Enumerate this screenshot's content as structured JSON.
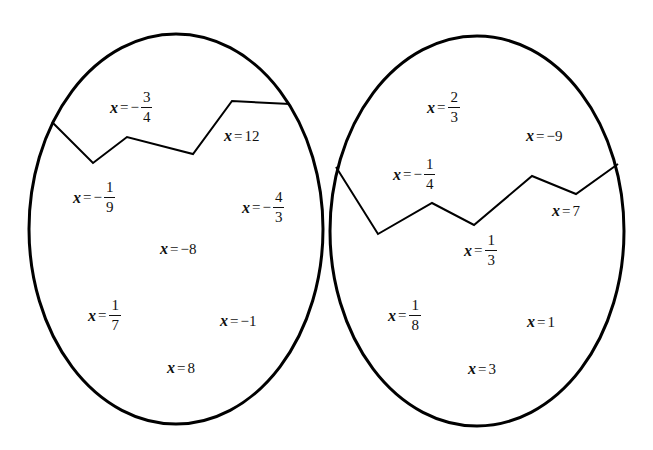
{
  "diagram": {
    "type": "two-cracked-eggs",
    "stroke_color": "#000000",
    "background": "#ffffff",
    "eggs": [
      {
        "id": "left-egg",
        "ellipse": {
          "cx": 176,
          "cy": 229,
          "rx": 147,
          "ry": 195
        },
        "crack_points": [
          [
            52,
            122
          ],
          [
            93,
            163
          ],
          [
            127,
            137
          ],
          [
            193,
            154
          ],
          [
            232,
            101
          ],
          [
            290,
            104
          ]
        ],
        "labels": [
          {
            "var": "x",
            "eq": "=",
            "sign": "−",
            "num": "3",
            "den": "4",
            "x": 110,
            "y": 90
          },
          {
            "var": "x",
            "eq": "=",
            "value": "12",
            "x": 224,
            "y": 128
          },
          {
            "var": "x",
            "eq": "=",
            "sign": "−",
            "num": "1",
            "den": "9",
            "x": 73,
            "y": 180
          },
          {
            "var": "x",
            "eq": "=",
            "sign": "−",
            "num": "4",
            "den": "3",
            "x": 242,
            "y": 190
          },
          {
            "var": "x",
            "eq": "=",
            "value": "−8",
            "x": 160,
            "y": 241
          },
          {
            "var": "x",
            "eq": "=",
            "num": "1",
            "den": "7",
            "x": 88,
            "y": 298
          },
          {
            "var": "x",
            "eq": "=",
            "value": "−1",
            "x": 220,
            "y": 313
          },
          {
            "var": "x",
            "eq": "=",
            "value": "8",
            "x": 167,
            "y": 360
          }
        ]
      },
      {
        "id": "right-egg",
        "ellipse": {
          "cx": 477,
          "cy": 231,
          "rx": 147,
          "ry": 195
        },
        "crack_points": [
          [
            336,
            167
          ],
          [
            378,
            234
          ],
          [
            432,
            203
          ],
          [
            474,
            225
          ],
          [
            532,
            176
          ],
          [
            576,
            194
          ],
          [
            618,
            164
          ]
        ],
        "labels": [
          {
            "var": "x",
            "eq": "=",
            "num": "2",
            "den": "3",
            "x": 427,
            "y": 90
          },
          {
            "var": "x",
            "eq": "=",
            "value": "−9",
            "x": 526,
            "y": 128
          },
          {
            "var": "x",
            "eq": "=",
            "sign": "−",
            "num": "1",
            "den": "4",
            "x": 393,
            "y": 157
          },
          {
            "var": "x",
            "eq": "=",
            "value": "7",
            "x": 552,
            "y": 203
          },
          {
            "var": "x",
            "eq": "=",
            "num": "1",
            "den": "3",
            "x": 464,
            "y": 233
          },
          {
            "var": "x",
            "eq": "=",
            "num": "1",
            "den": "8",
            "x": 388,
            "y": 298
          },
          {
            "var": "x",
            "eq": "=",
            "value": "1",
            "x": 527,
            "y": 314
          },
          {
            "var": "x",
            "eq": "=",
            "value": "3",
            "x": 468,
            "y": 361
          }
        ]
      }
    ]
  }
}
